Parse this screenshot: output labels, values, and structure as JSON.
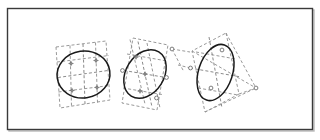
{
  "figure": {
    "title": "Ellipse construction from conjugate diameters",
    "canvas": {
      "width": 320,
      "height": 140,
      "background": "#ffffff"
    },
    "frame": {
      "name": "outer-border",
      "x": 7.5,
      "y": 8.5,
      "width": 305,
      "height": 121,
      "stroke": "#3a3a3a",
      "stroke_width": 1.4,
      "shadow_stroke": "#b9b9b9",
      "shadow_offset": 1.5
    },
    "style": {
      "solid_stroke": "#1a1a1a",
      "solid_width": 1.5,
      "dashed_stroke": "#8d8d8d",
      "dashed_width": 0.9,
      "dash_pattern": "3,2.2",
      "node_stroke": "#6f6f6f",
      "node_radius": 1.9,
      "cross_stroke": "#8d8d8d",
      "cross_arm": 2.6
    },
    "panels": [
      {
        "id": "panel-1",
        "label": "upright ellipse in near-square parallelogram",
        "parallelogram": [
          [
            56,
            47
          ],
          [
            106,
            41
          ],
          [
            110,
            100
          ],
          [
            60,
            108
          ]
        ],
        "ellipse": {
          "cx": 83.5,
          "cy": 74.5,
          "rx": 26.5,
          "ry": 23.5,
          "rotation_deg": -8
        },
        "conjugate_axes": [
          [
            [
              58,
              77.5
            ],
            [
              108,
              70.5
            ]
          ],
          [
            [
              83,
              44
            ],
            [
              85,
              104
            ]
          ]
        ],
        "grid_lines": [
          [
            [
              57,
              62
            ],
            [
              109,
              55.5
            ]
          ],
          [
            [
              58.5,
              92
            ],
            [
              109.5,
              85.5
            ]
          ],
          [
            [
              70,
              45.5
            ],
            [
              71.5,
              106
            ]
          ],
          [
            [
              95.5,
              42.5
            ],
            [
              97.5,
              102.5
            ]
          ]
        ],
        "cross_nodes": [
          [
            71,
            63.5
          ],
          [
            96,
            60.5
          ],
          [
            72,
            90.5
          ],
          [
            97,
            87.5
          ]
        ],
        "dot_nodes": []
      },
      {
        "id": "panel-2",
        "label": "tilted ellipse in sheared parallelogram",
        "parallelogram": [
          [
            133,
            38
          ],
          [
            168,
            45
          ],
          [
            157,
            110
          ],
          [
            122,
            103
          ]
        ],
        "ellipse": {
          "cx": 145,
          "cy": 74,
          "rx": 26,
          "ry": 19,
          "rotation_deg": -58
        },
        "conjugate_axes": [
          [
            [
              124,
              70.5
            ],
            [
              166,
              77.5
            ]
          ],
          [
            [
              138,
              41.5
            ],
            [
              152,
              107
            ]
          ]
        ],
        "grid_lines": [
          [
            [
              127,
              54
            ],
            [
              167,
              61
            ]
          ],
          [
            [
              123,
              88
            ],
            [
              162,
              94.5
            ]
          ],
          [
            [
              130,
              39.5
            ],
            [
              145,
              104
            ]
          ],
          [
            [
              147,
              43
            ],
            [
              160,
              108
            ]
          ]
        ],
        "cross_nodes": [
          [
            136,
            57
          ],
          [
            145,
            74
          ],
          [
            140,
            91
          ]
        ],
        "dot_nodes": [
          [
            122.5,
            70.5
          ],
          [
            166.5,
            77.5
          ],
          [
            156.5,
            98
          ],
          [
            172,
            49
          ]
        ],
        "leader_lines": [
          [
            [
              172,
              49
            ],
            [
              190,
              52
            ]
          ],
          [
            [
              172,
              49
            ],
            [
              184,
              72
            ]
          ]
        ]
      },
      {
        "id": "panel-3",
        "label": "steep narrow ellipse with extended construction triangle",
        "parallelogram": [
          [
            226,
            33
          ],
          [
            239,
            94
          ],
          [
            205,
            112
          ],
          [
            192,
            51
          ]
        ],
        "ellipse": {
          "cx": 215.5,
          "cy": 72.5,
          "rx": 29,
          "ry": 17,
          "rotation_deg": -72
        },
        "conjugate_axes": [
          [
            [
              190,
              68
            ],
            [
              241,
              77
            ]
          ],
          [
            [
              209,
              37
            ],
            [
              222,
              108
            ]
          ]
        ],
        "grid_lines": [
          [
            [
              196,
              52
            ],
            [
              236,
              59
            ]
          ],
          [
            [
              198,
              88
            ],
            [
              238,
              95
            ]
          ],
          [
            [
              226,
              33
            ],
            [
              256,
              88
            ]
          ],
          [
            [
              192,
              51
            ],
            [
              256,
              88
            ]
          ],
          [
            [
              205,
              112
            ],
            [
              256,
              88
            ]
          ],
          [
            [
              239,
              94
            ],
            [
              256,
              88
            ]
          ]
        ],
        "cross_nodes": [],
        "dot_nodes": [
          [
            222,
            50
          ],
          [
            211,
            88
          ],
          [
            256,
            88
          ],
          [
            190.5,
            68
          ]
        ],
        "leader_lines": [
          [
            [
              190.5,
              68
            ],
            [
              178,
              65
            ]
          ]
        ]
      }
    ]
  }
}
